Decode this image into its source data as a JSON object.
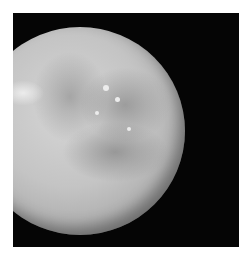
{
  "image": {
    "subject": "cratered moon against black space",
    "background_color": "#050505",
    "border_color": "#ffffff",
    "surface_tones": [
      "#d6d6d6",
      "#a9a9a9",
      "#6e6e6e"
    ]
  }
}
